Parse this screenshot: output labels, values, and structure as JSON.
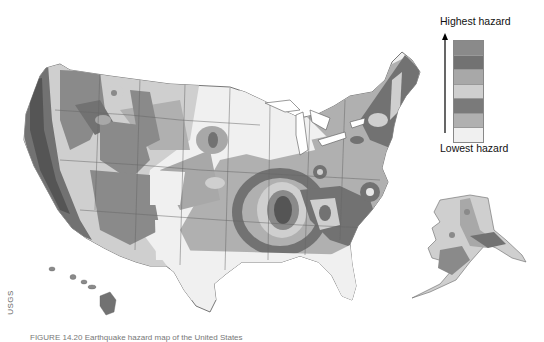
{
  "figure": {
    "credit": "USGS",
    "caption": "FIGURE 14.20 Earthquake hazard map of the United States"
  },
  "legend": {
    "high_label": "Highest hazard",
    "low_label": "Lowest hazard",
    "swatches": [
      {
        "level": 7,
        "color": "#8a8a8a"
      },
      {
        "level": 6,
        "color": "#727272"
      },
      {
        "level": 5,
        "color": "#a8a8a8"
      },
      {
        "level": 4,
        "color": "#cfcfcf"
      },
      {
        "level": 3,
        "color": "#7a7a7a"
      },
      {
        "level": 2,
        "color": "#b0b0b0"
      },
      {
        "level": 1,
        "color": "#f0f0f0"
      }
    ]
  },
  "map": {
    "regions": [
      "Conterminous United States",
      "Alaska",
      "Hawaii"
    ],
    "colors": {
      "lowest": "#f0f0f0",
      "low": "#cfcfcf",
      "moderate": "#b0b0b0",
      "elevated": "#a8a8a8",
      "high": "#8a8a8a",
      "very_high": "#727272",
      "highest": "#555555",
      "border": "#555555"
    }
  }
}
